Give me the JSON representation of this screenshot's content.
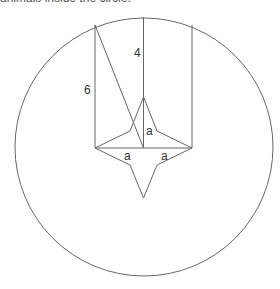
{
  "caption_cut": "animals inside the circle.",
  "labels": {
    "left_height": "6",
    "center_height": "4",
    "vertical_a": "a",
    "left_a": "a",
    "right_a": "a"
  },
  "colors": {
    "line": "#666666",
    "text": "#333333"
  }
}
